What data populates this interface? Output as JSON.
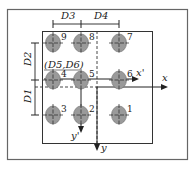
{
  "diagram": {
    "type": "hole pattern coordinate diagram",
    "holes": [
      {
        "id": "1",
        "label": "1",
        "x": 119,
        "y": 115
      },
      {
        "id": "2",
        "label": "2",
        "x": 81,
        "y": 115
      },
      {
        "id": "3",
        "label": "3",
        "x": 53,
        "y": 115
      },
      {
        "id": "4",
        "label": "4",
        "x": 53,
        "y": 80
      },
      {
        "id": "5",
        "label": "5",
        "x": 81,
        "y": 80
      },
      {
        "id": "6",
        "label": "6",
        "x": 119,
        "y": 80
      },
      {
        "id": "7",
        "label": "7",
        "x": 119,
        "y": 43
      },
      {
        "id": "8",
        "label": "8",
        "x": 81,
        "y": 43
      },
      {
        "id": "9",
        "label": "9",
        "x": 53,
        "y": 43
      }
    ],
    "dimensions": {
      "d1": "D1",
      "d2": "D2",
      "d3": "D3",
      "d4": "D4",
      "origin_label": "(D5,D6)"
    },
    "axes": {
      "x": "x",
      "y": "y",
      "x_prime": "x'",
      "y_prime": "y'"
    },
    "colors": {
      "hole_fill": "#9a9a9a",
      "line": "#222222",
      "frame": "#555555"
    }
  }
}
